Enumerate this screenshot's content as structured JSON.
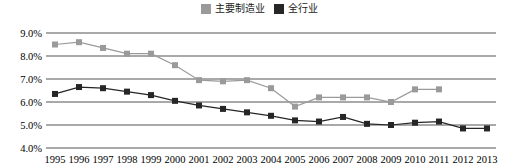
{
  "legend": {
    "entries": [
      {
        "label": "主要制造业",
        "color": "#9a9a9a",
        "icon": "square-swatch-gray"
      },
      {
        "label": "全行业",
        "color": "#262626",
        "icon": "square-swatch-black"
      }
    ]
  },
  "chart_data": {
    "type": "line",
    "title": "",
    "xlabel": "",
    "ylabel": "",
    "ylim": [
      4.0,
      9.0
    ],
    "ytick_step": 1.0,
    "ytick_labels": [
      "9.0%",
      "8.0%",
      "7.0%",
      "6.0%",
      "5.0%",
      "4.0%"
    ],
    "ytick_values": [
      9.0,
      8.0,
      7.0,
      6.0,
      5.0,
      4.0
    ],
    "grid": true,
    "legend_position": "top-center",
    "marker": "square",
    "categories": [
      "1995",
      "1996",
      "1997",
      "1998",
      "1999",
      "2000",
      "2001",
      "2002",
      "2003",
      "2004",
      "2005",
      "2006",
      "2007",
      "2008",
      "2009",
      "2010",
      "2011",
      "2012",
      "2013"
    ],
    "series": [
      {
        "name": "主要制造业",
        "color": "#9a9a9a",
        "values": [
          8.5,
          8.6,
          8.35,
          8.1,
          8.1,
          7.6,
          6.95,
          6.9,
          6.95,
          6.6,
          5.8,
          6.2,
          6.2,
          6.2,
          6.0,
          6.55,
          6.55,
          null,
          null
        ]
      },
      {
        "name": "全行业",
        "color": "#262626",
        "values": [
          6.35,
          6.65,
          6.6,
          6.45,
          6.3,
          6.05,
          5.85,
          5.7,
          5.55,
          5.4,
          5.2,
          5.15,
          5.35,
          5.05,
          5.0,
          5.1,
          5.15,
          4.85,
          4.85
        ]
      }
    ]
  }
}
